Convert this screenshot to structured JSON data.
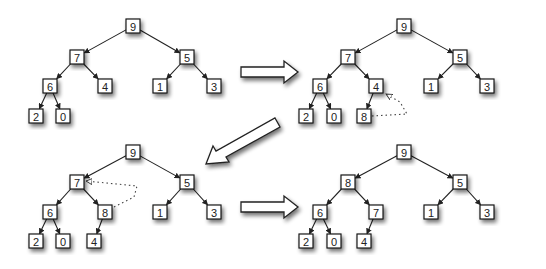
{
  "diagram": {
    "title": "",
    "box_size": 14,
    "colors": {
      "stroke": "#1a1a1a",
      "fill": "#ffffff",
      "shadow": "#888888"
    },
    "trees": [
      {
        "id": "step-1",
        "nodes": [
          {
            "id": "a",
            "label": "9",
            "x": 133,
            "y": 26
          },
          {
            "id": "b",
            "label": "7",
            "x": 77,
            "y": 57
          },
          {
            "id": "c",
            "label": "5",
            "x": 187,
            "y": 57
          },
          {
            "id": "d",
            "label": "6",
            "x": 50,
            "y": 86
          },
          {
            "id": "e",
            "label": "4",
            "x": 105,
            "y": 86
          },
          {
            "id": "f",
            "label": "1",
            "x": 160,
            "y": 86
          },
          {
            "id": "g",
            "label": "3",
            "x": 214,
            "y": 86
          },
          {
            "id": "h",
            "label": "2",
            "x": 36,
            "y": 116
          },
          {
            "id": "i",
            "label": "0",
            "x": 63,
            "y": 116
          }
        ],
        "edges": [
          [
            "a",
            "b"
          ],
          [
            "a",
            "c"
          ],
          [
            "b",
            "d"
          ],
          [
            "b",
            "e"
          ],
          [
            "c",
            "f"
          ],
          [
            "c",
            "g"
          ],
          [
            "d",
            "h"
          ],
          [
            "d",
            "i"
          ]
        ],
        "swap": null
      },
      {
        "id": "step-2",
        "nodes": [
          {
            "id": "a",
            "label": "9",
            "x": 404,
            "y": 26
          },
          {
            "id": "b",
            "label": "7",
            "x": 348,
            "y": 57
          },
          {
            "id": "c",
            "label": "5",
            "x": 460,
            "y": 57
          },
          {
            "id": "d",
            "label": "6",
            "x": 320,
            "y": 86
          },
          {
            "id": "e",
            "label": "4",
            "x": 376,
            "y": 86
          },
          {
            "id": "f",
            "label": "1",
            "x": 431,
            "y": 86
          },
          {
            "id": "g",
            "label": "3",
            "x": 487,
            "y": 86
          },
          {
            "id": "h",
            "label": "2",
            "x": 306,
            "y": 116
          },
          {
            "id": "i",
            "label": "0",
            "x": 334,
            "y": 116
          },
          {
            "id": "j",
            "label": "8",
            "x": 364,
            "y": 116
          }
        ],
        "edges": [
          [
            "a",
            "b"
          ],
          [
            "a",
            "c"
          ],
          [
            "b",
            "d"
          ],
          [
            "b",
            "e"
          ],
          [
            "c",
            "f"
          ],
          [
            "c",
            "g"
          ],
          [
            "d",
            "h"
          ],
          [
            "d",
            "i"
          ],
          [
            "e",
            "j"
          ]
        ],
        "swap": {
          "from": "j",
          "to": "e",
          "path": "M 372 116 L 407 114 L 400 102 L 386 94"
        }
      },
      {
        "id": "step-3",
        "nodes": [
          {
            "id": "a",
            "label": "9",
            "x": 133,
            "y": 152
          },
          {
            "id": "b",
            "label": "7",
            "x": 77,
            "y": 182
          },
          {
            "id": "c",
            "label": "5",
            "x": 187,
            "y": 182
          },
          {
            "id": "d",
            "label": "6",
            "x": 50,
            "y": 212
          },
          {
            "id": "e",
            "label": "8",
            "x": 105,
            "y": 212
          },
          {
            "id": "f",
            "label": "1",
            "x": 160,
            "y": 212
          },
          {
            "id": "g",
            "label": "3",
            "x": 214,
            "y": 212
          },
          {
            "id": "h",
            "label": "2",
            "x": 36,
            "y": 241
          },
          {
            "id": "i",
            "label": "0",
            "x": 63,
            "y": 241
          },
          {
            "id": "j",
            "label": "4",
            "x": 94,
            "y": 241
          }
        ],
        "edges": [
          [
            "a",
            "b"
          ],
          [
            "a",
            "c"
          ],
          [
            "b",
            "d"
          ],
          [
            "b",
            "e"
          ],
          [
            "c",
            "f"
          ],
          [
            "c",
            "g"
          ],
          [
            "d",
            "h"
          ],
          [
            "d",
            "i"
          ],
          [
            "e",
            "j"
          ]
        ],
        "swap": {
          "from": "e",
          "to": "b",
          "path": "M 114 207 L 134 197 L 137 186 L 86 181"
        }
      },
      {
        "id": "step-4",
        "nodes": [
          {
            "id": "a",
            "label": "9",
            "x": 404,
            "y": 152
          },
          {
            "id": "b",
            "label": "8",
            "x": 348,
            "y": 182
          },
          {
            "id": "c",
            "label": "5",
            "x": 460,
            "y": 182
          },
          {
            "id": "d",
            "label": "6",
            "x": 320,
            "y": 212
          },
          {
            "id": "e",
            "label": "7",
            "x": 376,
            "y": 212
          },
          {
            "id": "f",
            "label": "1",
            "x": 431,
            "y": 212
          },
          {
            "id": "g",
            "label": "3",
            "x": 487,
            "y": 212
          },
          {
            "id": "h",
            "label": "2",
            "x": 306,
            "y": 241
          },
          {
            "id": "i",
            "label": "0",
            "x": 334,
            "y": 241
          },
          {
            "id": "j",
            "label": "4",
            "x": 364,
            "y": 241
          }
        ],
        "edges": [
          [
            "a",
            "b"
          ],
          [
            "a",
            "c"
          ],
          [
            "b",
            "d"
          ],
          [
            "b",
            "e"
          ],
          [
            "c",
            "f"
          ],
          [
            "c",
            "g"
          ],
          [
            "d",
            "h"
          ],
          [
            "d",
            "i"
          ],
          [
            "e",
            "j"
          ]
        ],
        "swap": null
      }
    ],
    "transitions": [
      {
        "id": "arrow-1-to-2",
        "direction": "right",
        "points": "241,67 284,67 284,61 298,72 284,83 284,77 241,77"
      },
      {
        "id": "arrow-2-to-3",
        "direction": "down-left",
        "points": "275,118 280,127 226,157 229,162 206,164 213,146 216,151"
      },
      {
        "id": "arrow-3-to-4",
        "direction": "right",
        "points": "241,202 284,202 284,196 298,207 284,218 284,212 241,212"
      }
    ]
  }
}
